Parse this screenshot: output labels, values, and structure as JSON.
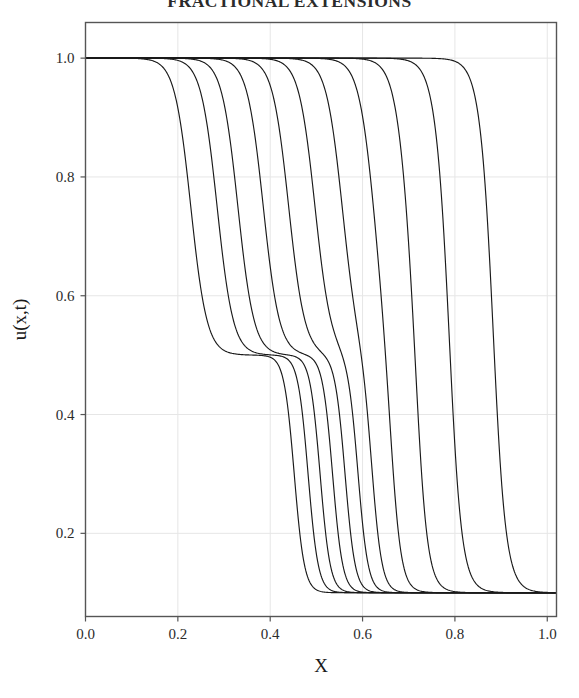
{
  "page": {
    "running_head": "FRACTIONAL EXTENSIONS"
  },
  "figure": {
    "name": "solution-profiles-plot",
    "background": "#ffffff",
    "frame_color": "#555555",
    "grid_color": "#e6e6e6",
    "curve_color": "#1a1a1a"
  },
  "chart_data": {
    "type": "line",
    "title": "",
    "xlabel": "X",
    "ylabel": "u(x,t)",
    "xlim": [
      0.0,
      1.02
    ],
    "ylim": [
      0.06,
      1.06
    ],
    "grid": true,
    "legend": "none",
    "xticks": [
      0.0,
      0.2,
      0.4,
      0.6,
      0.8,
      1.0
    ],
    "xticklabels": [
      "0.0",
      "0.2",
      "0.4",
      "0.6",
      "0.8",
      "1.0"
    ],
    "yticks": [
      0.2,
      0.4,
      0.6,
      0.8,
      1.0
    ],
    "yticklabels": [
      "0.2",
      "0.4",
      "0.6",
      "0.8",
      "1.0"
    ],
    "plateau_upper": 1.0,
    "plateau_middle": 0.5,
    "plateau_lower": 0.1,
    "n_curves": 11,
    "shock_width_upper": 0.035,
    "shock_width_lower": 0.022,
    "series": [
      {
        "name": "t1",
        "front_upper": 0.228,
        "front_lower": 0.452,
        "plateau_mid_len": 0.224
      },
      {
        "name": "t2",
        "front_upper": 0.285,
        "front_lower": 0.482,
        "plateau_mid_len": 0.197
      },
      {
        "name": "t3",
        "front_upper": 0.33,
        "front_lower": 0.508,
        "plateau_mid_len": 0.178
      },
      {
        "name": "t4",
        "front_upper": 0.385,
        "front_lower": 0.535,
        "plateau_mid_len": 0.15
      },
      {
        "name": "t5",
        "front_upper": 0.44,
        "front_lower": 0.562,
        "plateau_mid_len": 0.122
      },
      {
        "name": "t6",
        "front_upper": 0.497,
        "front_lower": 0.59,
        "plateau_mid_len": 0.093
      },
      {
        "name": "t7",
        "front_upper": 0.556,
        "front_lower": 0.62,
        "plateau_mid_len": 0.064
      },
      {
        "name": "t8",
        "front_upper": 0.625,
        "front_lower": 0.662,
        "plateau_mid_len": 0.037
      },
      {
        "name": "t9",
        "front_upper": 0.7,
        "front_lower": 0.718,
        "plateau_mid_len": 0.018
      },
      {
        "name": "t10",
        "front_upper": 0.782,
        "front_lower": 0.79,
        "plateau_mid_len": 0.008
      },
      {
        "name": "t11",
        "front_upper": 0.88,
        "front_lower": 0.884,
        "plateau_mid_len": 0.004
      }
    ]
  }
}
